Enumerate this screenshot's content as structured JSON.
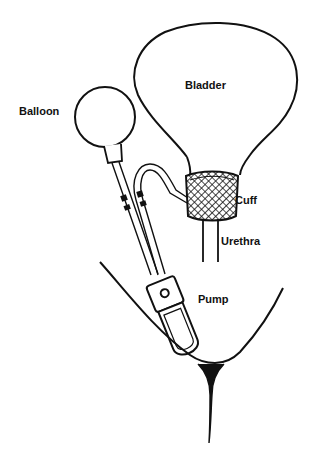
{
  "diagram": {
    "type": "anatomical-illustration",
    "stroke_color": "#111111",
    "background_color": "#ffffff",
    "labels": {
      "bladder": "Bladder",
      "balloon": "Balloon",
      "cuff": "Cuff",
      "urethra": "Urethra",
      "pump": "Pump"
    },
    "components": [
      {
        "id": "bladder",
        "label": "Bladder"
      },
      {
        "id": "balloon",
        "label": "Balloon"
      },
      {
        "id": "cuff",
        "label": "Cuff"
      },
      {
        "id": "urethra",
        "label": "Urethra"
      },
      {
        "id": "pump",
        "label": "Pump"
      }
    ],
    "connections": [
      {
        "from": "balloon",
        "to": "pump"
      },
      {
        "from": "pump",
        "to": "cuff"
      },
      {
        "from": "bladder",
        "to": "urethra"
      }
    ]
  }
}
